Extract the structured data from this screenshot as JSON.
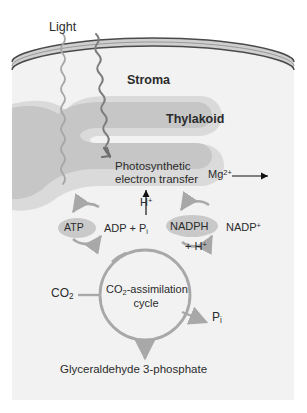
{
  "figure": {
    "colors": {
      "background": "#ffffff",
      "chloroplast_fill": "#f1f1f1",
      "membrane_fill": "#cfcfcf",
      "membrane_stroke": "#4a4a4a",
      "thylakoid_fill": "#c5c5c5",
      "arrow_gray": "#a8a8a8",
      "arrow_black": "#111111",
      "text": "#2b2b2b",
      "pill_fill": "#c9c9c9"
    }
  },
  "labels": {
    "light": "Light",
    "stroma": "Stroma",
    "thylakoid": "Thylakoid",
    "photosynthetic_line1": "Photosynthetic",
    "photosynthetic_line2": "electron transfer",
    "magnesium": "Mg",
    "magnesium_charge": "2+",
    "proton": "H",
    "proton_charge": "+",
    "atp": "ATP",
    "adp_text": "ADP + P",
    "adp_sub": "i",
    "nadph": "NADPH",
    "nadp": "NADP",
    "nadp_charge": "+",
    "plus_h": "+ H",
    "plus_h_charge": "+",
    "co2_text": "CO",
    "co2_sub": "2",
    "cycle_line1_a": "CO",
    "cycle_line1_sub": "2",
    "cycle_line1_b": "-assimilation",
    "cycle_line2": "cycle",
    "pi_text": "P",
    "pi_sub": "i",
    "product": "Glyceraldehyde 3-phosphate"
  },
  "icons": {
    "light_ray_left": "wavy-arrow-icon",
    "light_ray_right": "wavy-arrow-icon",
    "mg_arrow": "right-arrow-icon",
    "h_arrow": "up-arrow-icon",
    "atp_cycle": "circular-arrow-icon",
    "nadph_cycle": "circular-arrow-icon",
    "assimilation_cycle": "circular-arrow-icon",
    "product_arrow": "down-arrow-icon",
    "pi_arrow": "right-arrow-icon"
  }
}
